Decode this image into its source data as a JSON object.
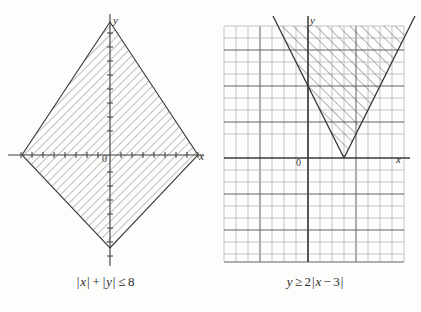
{
  "page": {
    "background": "#fdfdfc",
    "ink": "#2b2b2b",
    "grid_color": "#9aa3ad",
    "grid_color_major": "#5d646c",
    "hatch_color": "#4a4a4a"
  },
  "figures": [
    {
      "id": "left",
      "caption": {
        "full": "|x| + |y| ≤ 8",
        "lhs_abs_x": "x",
        "lhs_abs_y": "y",
        "plus": "+",
        "relation": "≤",
        "rhs": "8"
      },
      "axes": {
        "x_label": "x",
        "y_label": "y",
        "origin_label": "0",
        "show_grid": false,
        "show_ticks": true,
        "x_tick_count": 16,
        "y_tick_count": 16
      },
      "region": {
        "shape": "diamond",
        "description": "closed diamond with vertices at (±8,0) and (0,±8)",
        "vertices": [
          [
            8,
            0
          ],
          [
            0,
            8
          ],
          [
            -8,
            0
          ],
          [
            0,
            -8
          ]
        ],
        "boundary": "solid",
        "hatch_angle_deg": 45,
        "hatch_spacing_px": 6
      }
    },
    {
      "id": "right",
      "caption": {
        "full": "y ≥ 2|x − 3|",
        "lhs": "y",
        "relation": "≥",
        "coefficient": "2",
        "abs_arg_var": "x",
        "abs_arg_op": "−",
        "abs_arg_num": "3"
      },
      "axes": {
        "x_label": "x",
        "y_label": "y",
        "origin_label": "0",
        "show_grid": true,
        "show_ticks": false,
        "grid_cols": 15,
        "grid_rows": 20
      },
      "region": {
        "shape": "v-wedge",
        "description": "region on and above the V formed by y = 2|x − 3|, vertex at (3,0)",
        "vertex": [
          3,
          0
        ],
        "slope": 2,
        "boundary": "solid",
        "hatch_angle_deg": 45,
        "hatch_spacing_px": 8
      }
    }
  ]
}
